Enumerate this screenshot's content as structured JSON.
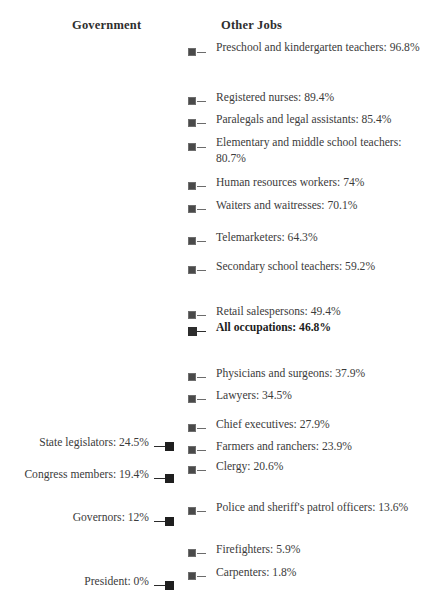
{
  "headers": {
    "government": "Government",
    "other_jobs": "Other Jobs"
  },
  "chart_data": {
    "type": "scatter",
    "title": "",
    "subtitle": "",
    "xlabel": "",
    "ylabel": "",
    "ylim": [
      0,
      100
    ],
    "grid": false,
    "legend_position": "top",
    "orientation": "vertical-position-encodes-percent",
    "units": "percent",
    "series": [
      {
        "name": "Government",
        "side": "left",
        "points": [
          {
            "label": "State legislators: 24.5%",
            "occupation": "State legislators",
            "value": 24.5,
            "y": 446
          },
          {
            "label": "Congress members: 19.4%",
            "occupation": "Congress members",
            "value": 19.4,
            "y": 478
          },
          {
            "label": "Governors: 12%",
            "occupation": "Governors",
            "value": 12,
            "y": 521
          },
          {
            "label": "President: 0%",
            "occupation": "President",
            "value": 0,
            "y": 585
          }
        ]
      },
      {
        "name": "Other Jobs",
        "side": "right",
        "points": [
          {
            "label": "Preschool and kindergarten teachers: 96.8%",
            "occupation": "Preschool and kindergarten teachers",
            "value": 96.8,
            "y": 52,
            "lines": 2,
            "emphasis": false
          },
          {
            "label": "Registered nurses: 89.4%",
            "occupation": "Registered nurses",
            "value": 89.4,
            "y": 101,
            "lines": 1,
            "emphasis": false
          },
          {
            "label": "Paralegals and legal assistants: 85.4%",
            "occupation": "Paralegals and legal assistants",
            "value": 85.4,
            "y": 123,
            "lines": 1,
            "emphasis": false
          },
          {
            "label": "Elementary and middle school teachers: 80.7%",
            "occupation": "Elementary and middle school teachers",
            "value": 80.7,
            "y": 147,
            "lines": 2,
            "emphasis": false
          },
          {
            "label": "Human resources workers: 74%",
            "occupation": "Human resources workers",
            "value": 74,
            "y": 186,
            "lines": 1,
            "emphasis": false
          },
          {
            "label": "Waiters and waitresses: 70.1%",
            "occupation": "Waiters and waitresses",
            "value": 70.1,
            "y": 209,
            "lines": 1,
            "emphasis": false
          },
          {
            "label": "Telemarketers: 64.3%",
            "occupation": "Telemarketers",
            "value": 64.3,
            "y": 241,
            "lines": 1,
            "emphasis": false
          },
          {
            "label": "Secondary school teachers: 59.2%",
            "occupation": "Secondary school teachers",
            "value": 59.2,
            "y": 270,
            "lines": 1,
            "emphasis": false
          },
          {
            "label": "Retail salespersons: 49.4%",
            "occupation": "Retail salespersons",
            "value": 49.4,
            "y": 315,
            "lines": 1,
            "emphasis": false
          },
          {
            "label": "All occupations: 46.8%",
            "occupation": "All occupations",
            "value": 46.8,
            "y": 331,
            "lines": 1,
            "emphasis": true
          },
          {
            "label": "Physicians and surgeons: 37.9%",
            "occupation": "Physicians and surgeons",
            "value": 37.9,
            "y": 377,
            "lines": 1,
            "emphasis": false
          },
          {
            "label": "Lawyers: 34.5%",
            "occupation": "Lawyers",
            "value": 34.5,
            "y": 399,
            "lines": 1,
            "emphasis": false
          },
          {
            "label": "Chief executives: 27.9%",
            "occupation": "Chief executives",
            "value": 27.9,
            "y": 428,
            "lines": 1,
            "emphasis": false
          },
          {
            "label": "Farmers and ranchers: 23.9%",
            "occupation": "Farmers and ranchers",
            "value": 23.9,
            "y": 450,
            "lines": 1,
            "emphasis": false
          },
          {
            "label": "Clergy: 20.6%",
            "occupation": "Clergy",
            "value": 20.6,
            "y": 470,
            "lines": 1,
            "emphasis": false
          },
          {
            "label": "Police and sheriff's patrol officers: 13.6%",
            "occupation": "Police and sheriff's patrol officers",
            "value": 13.6,
            "y": 511,
            "lines": 1,
            "emphasis": false
          },
          {
            "label": "Firefighters: 5.9%",
            "occupation": "Firefighters",
            "value": 5.9,
            "y": 553,
            "lines": 1,
            "emphasis": false
          },
          {
            "label": "Carpenters: 1.8%",
            "occupation": "Carpenters",
            "value": 1.8,
            "y": 576,
            "lines": 1,
            "emphasis": false
          }
        ]
      }
    ]
  },
  "colors": {
    "background": "#ffffff",
    "text": "#3b3b3b",
    "header_text": "#2e2e2e",
    "marker_other_jobs": "#4a4a4a",
    "marker_government": "#1f1f1f",
    "marker_emphasis": "#2d2d2d"
  }
}
